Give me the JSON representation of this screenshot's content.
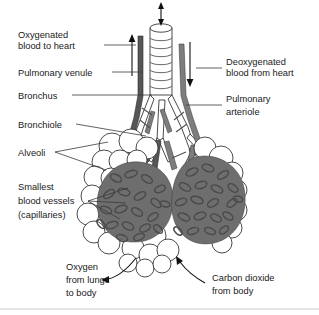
{
  "figure": {
    "background_color": "#ffffff",
    "ink_color": "#1a1a1a",
    "vessel_dark_color": "#565656",
    "vessel_mid_color": "#7d7d7d",
    "capillary_color": "#6e6e6e",
    "alveoli_fill": "#ffffff"
  },
  "labels": {
    "oxygenated_blood": {
      "line1": "Oxygenated",
      "line2": "blood to heart"
    },
    "pulmonary_venule": {
      "line1": "Pulmonary venule"
    },
    "bronchus": {
      "line1": "Bronchus"
    },
    "bronchiole": {
      "line1": "Bronchiole"
    },
    "alveoli": {
      "line1": "Alveoli"
    },
    "capillaries": {
      "line1": "Smallest",
      "line2": "blood vessels",
      "line3": "(capillaries)"
    },
    "deoxygenated_blood": {
      "line1": "Deoxygenated",
      "line2": "blood from heart"
    },
    "pulmonary_arteriole": {
      "line1": "Pulmonary",
      "line2": "arteriole"
    },
    "oxygen_out": {
      "line1": "Oxygen",
      "line2": "from lungs",
      "line3": "to body"
    },
    "carbon_dioxide_in": {
      "line1": "Carbon dioxide",
      "line2": "from body"
    }
  },
  "structures": {
    "trachea": "trachea-with-cartilage-rings",
    "airflow_arrow": "double-headed-vertical-arrow",
    "venule_arrow_direction": "up",
    "arteriole_arrow_direction": "down",
    "oxygen_arrow_direction": "left",
    "carbon_dioxide_arrow_direction": "up-left"
  }
}
